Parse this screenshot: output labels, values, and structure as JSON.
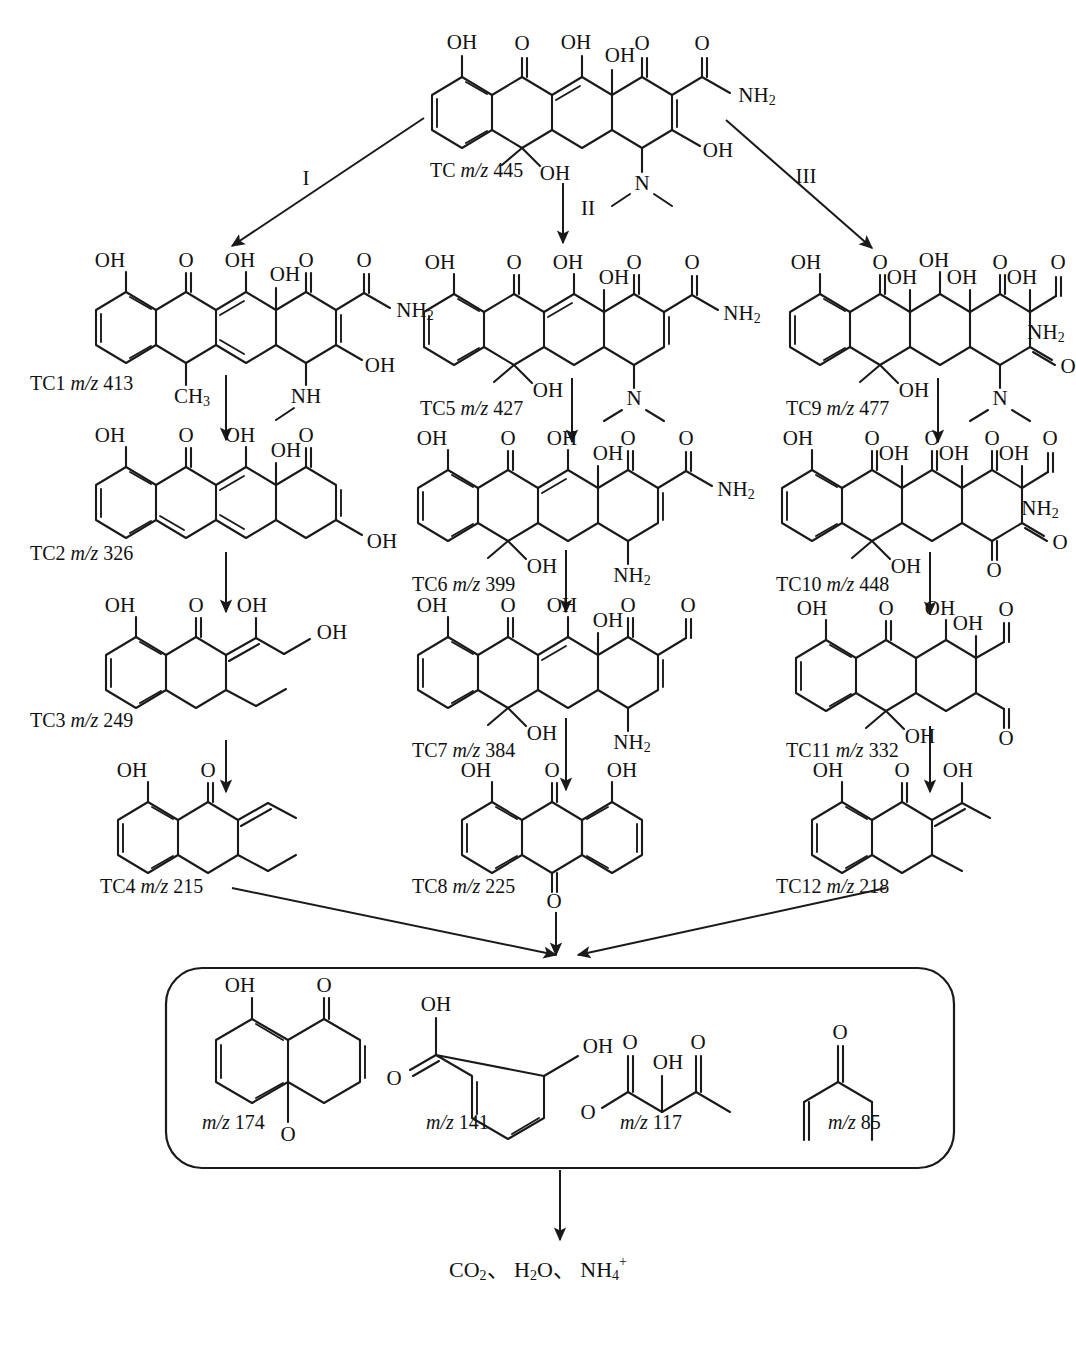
{
  "diagram": {
    "parent": {
      "id": "TC",
      "mz_prefix": "m/z",
      "mz": "445",
      "label": "TC m/z 445"
    },
    "pathway_labels": [
      {
        "name": "I",
        "text": "I"
      },
      {
        "name": "II",
        "text": "II"
      },
      {
        "name": "III",
        "text": "III"
      }
    ],
    "intermediates": [
      {
        "id": "TC1",
        "mz": "413",
        "label": "TC1 m/z 413",
        "pathway": "I",
        "row": 1
      },
      {
        "id": "TC2",
        "mz": "326",
        "label": "TC2 m/z 326",
        "pathway": "I",
        "row": 2
      },
      {
        "id": "TC3",
        "mz": "249",
        "label": "TC3 m/z 249",
        "pathway": "I",
        "row": 3
      },
      {
        "id": "TC4",
        "mz": "215",
        "label": "TC4 m/z 215",
        "pathway": "I",
        "row": 4
      },
      {
        "id": "TC5",
        "mz": "427",
        "label": "TC5 m/z 427",
        "pathway": "II",
        "row": 1
      },
      {
        "id": "TC6",
        "mz": "399",
        "label": "TC6 m/z 399",
        "pathway": "II",
        "row": 2
      },
      {
        "id": "TC7",
        "mz": "384",
        "label": "TC7 m/z 384",
        "pathway": "II",
        "row": 3
      },
      {
        "id": "TC8",
        "mz": "225",
        "label": "TC8 m/z 225",
        "pathway": "II",
        "row": 4
      },
      {
        "id": "TC9",
        "mz": "477",
        "label": "TC9 m/z 477",
        "pathway": "III",
        "row": 1
      },
      {
        "id": "TC10",
        "mz": "448",
        "label": "TC10 m/z 448",
        "pathway": "III",
        "row": 2
      },
      {
        "id": "TC11",
        "mz": "332",
        "label": "TC11 m/z 332",
        "pathway": "III",
        "row": 3
      },
      {
        "id": "TC12",
        "mz": "218",
        "label": "TC12 m/z 218",
        "pathway": "III",
        "row": 4
      }
    ],
    "small_products_box": {
      "items": [
        {
          "label": "m/z 174",
          "mz": "174"
        },
        {
          "label": "m/z 141",
          "mz": "141"
        },
        {
          "label": "m/z 117",
          "mz": "117"
        },
        {
          "label": "m/z 85",
          "mz": "85"
        }
      ]
    },
    "mineralization": {
      "label": "CO2、 H2O、 NH4+"
    },
    "atom_labels": {
      "oh": "OH",
      "o": "O",
      "n": "N",
      "nh": "NH",
      "nh2": "NH2",
      "ch3": "CH3",
      "mz": "m/z"
    },
    "colors": {
      "ink": "#1a1a1a",
      "background": "#ffffff"
    }
  }
}
